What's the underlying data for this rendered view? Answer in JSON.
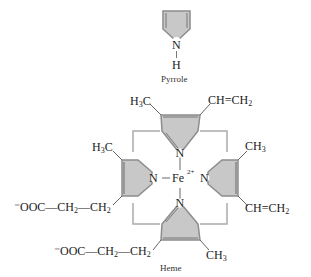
{
  "pyrrole": {
    "caption": "Pyrrole",
    "n_label": "N",
    "h_label": "H"
  },
  "heme": {
    "caption": "Heme",
    "center_label": "Fe",
    "charge": "2+",
    "n_label": "N",
    "substituents": {
      "top_left": {
        "main": "H",
        "sub": "3",
        "tail": "C"
      },
      "top_right": {
        "main": "CH",
        "bond": "=",
        "tail": "CH",
        "sub": "2"
      },
      "left_top": {
        "main": "H",
        "sub": "3",
        "tail": "C"
      },
      "right_top": {
        "main": "CH",
        "sub": "3"
      },
      "right_bottom": {
        "main": "CH",
        "bond": "=",
        "tail": "CH",
        "sub": "2"
      },
      "bottom_right": {
        "main": "CH",
        "sub": "3"
      },
      "left_chain": {
        "prefix": "⁻OOC—CH",
        "sub1": "2",
        "mid": "—CH",
        "sub2": "2"
      },
      "bottom_chain": {
        "prefix": "⁻OOC—CH",
        "sub1": "2",
        "mid": "—CH",
        "sub2": "2"
      }
    }
  },
  "colors": {
    "ring_fill": "#c8c8c8",
    "ring_edge": "#8c8c8c",
    "bridge": "#aaaaaa",
    "text": "#222222"
  }
}
